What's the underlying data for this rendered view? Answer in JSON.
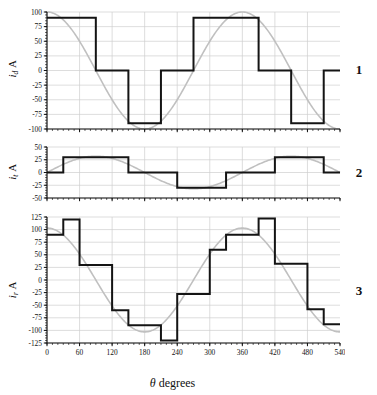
{
  "figure": {
    "xlabel_symbol": "θ",
    "xlabel_text": " degrees",
    "unit": "A"
  },
  "panels": [
    {
      "index_label": "1",
      "ylabel_symbol": "i",
      "ylabel_sub": "d",
      "ylabel_unit": "A",
      "yticks": [
        100,
        75,
        50,
        25,
        0,
        -25,
        -50,
        -75,
        -100
      ],
      "ylim": [
        -100,
        100
      ]
    },
    {
      "index_label": "2",
      "ylabel_symbol": "i",
      "ylabel_sub": "t",
      "ylabel_unit": "A",
      "yticks": [
        50,
        25,
        0,
        -25,
        -50
      ],
      "ylim": [
        -50,
        50
      ]
    },
    {
      "index_label": "3",
      "ylabel_symbol": "i",
      "ylabel_sub": "r",
      "ylabel_unit": "A",
      "yticks": [
        125,
        100,
        75,
        50,
        25,
        0,
        -25,
        -50,
        -75,
        -100,
        -125
      ],
      "ylim": [
        -125,
        125
      ]
    }
  ],
  "chart_data": [
    {
      "type": "line",
      "title": "",
      "panel": "1",
      "xlabel": "θ degrees",
      "ylabel": "i_d A",
      "xlim": [
        0,
        540
      ],
      "ylim": [
        -100,
        100
      ],
      "xticks": [
        0,
        60,
        120,
        180,
        240,
        300,
        360,
        420,
        480,
        540
      ],
      "yticks": [
        100,
        75,
        50,
        25,
        0,
        -25,
        -50,
        -75,
        -100
      ],
      "grid": true,
      "legend": "none",
      "series": [
        {
          "name": "six-step current",
          "style": "step",
          "color": "#141414",
          "step_edges": [
            0,
            30,
            90,
            150,
            210,
            270,
            330,
            390,
            450,
            510,
            540
          ],
          "step_values": [
            90,
            90,
            0,
            -90,
            0,
            90,
            90,
            0,
            -90,
            0
          ]
        },
        {
          "name": "fundamental sine reference",
          "style": "smooth",
          "color": "#c0c0c0",
          "amplitude": 100,
          "period": 360,
          "phase_deg": 90,
          "description": "100*cos(theta)"
        }
      ]
    },
    {
      "type": "line",
      "title": "",
      "panel": "2",
      "xlabel": "θ degrees",
      "ylabel": "i_t A",
      "xlim": [
        0,
        540
      ],
      "ylim": [
        -50,
        50
      ],
      "xticks": [
        0,
        60,
        120,
        180,
        240,
        300,
        360,
        420,
        480,
        540
      ],
      "yticks": [
        50,
        25,
        0,
        -25,
        -50
      ],
      "grid": true,
      "legend": "none",
      "series": [
        {
          "name": "six-step current",
          "style": "step",
          "color": "#141414",
          "step_edges": [
            0,
            30,
            120,
            150,
            240,
            300,
            330,
            420,
            480,
            510,
            540
          ],
          "step_values": [
            0,
            30,
            30,
            0,
            -30,
            -30,
            0,
            30,
            30,
            0
          ]
        },
        {
          "name": "fundamental sine reference",
          "style": "smooth",
          "color": "#c0c0c0",
          "amplitude": 32,
          "period": 360,
          "phase_deg": 0,
          "description": "32*sin(theta)"
        }
      ]
    },
    {
      "type": "line",
      "title": "",
      "panel": "3",
      "xlabel": "θ degrees",
      "ylabel": "i_r A",
      "xlim": [
        0,
        540
      ],
      "ylim": [
        -125,
        125
      ],
      "xticks": [
        0,
        60,
        120,
        180,
        240,
        300,
        360,
        420,
        480,
        540
      ],
      "yticks": [
        125,
        100,
        75,
        50,
        25,
        0,
        -25,
        -50,
        -75,
        -100,
        -125
      ],
      "grid": true,
      "legend": "none",
      "series": [
        {
          "name": "twelve-step current",
          "style": "step",
          "color": "#141414",
          "step_edges": [
            0,
            30,
            60,
            120,
            150,
            180,
            210,
            240,
            300,
            330,
            390,
            420,
            480,
            510,
            540
          ],
          "step_values": [
            90,
            120,
            30,
            -60,
            -90,
            -90,
            -120,
            -28,
            60,
            90,
            122,
            32,
            -58,
            -88
          ]
        },
        {
          "name": "fundamental sine reference",
          "style": "smooth",
          "color": "#c0c0c0",
          "amplitude": 103,
          "period": 360,
          "phase_deg": 90,
          "description": "103*cos(theta)"
        }
      ]
    }
  ]
}
